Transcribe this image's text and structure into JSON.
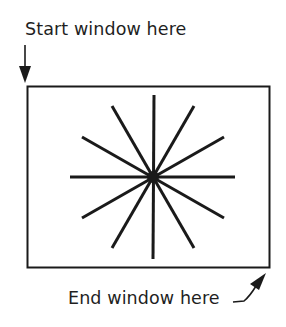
{
  "labels": {
    "start": "Start window here",
    "end": "End window here"
  },
  "diagram": {
    "window_rect": {
      "x": 27,
      "y": 86,
      "width": 242,
      "height": 182
    },
    "starburst": {
      "center_x": 153,
      "center_y": 177,
      "spoke_count": 12
    },
    "colors": {
      "ink": "#1a1a1a",
      "background": "#ffffff"
    }
  }
}
